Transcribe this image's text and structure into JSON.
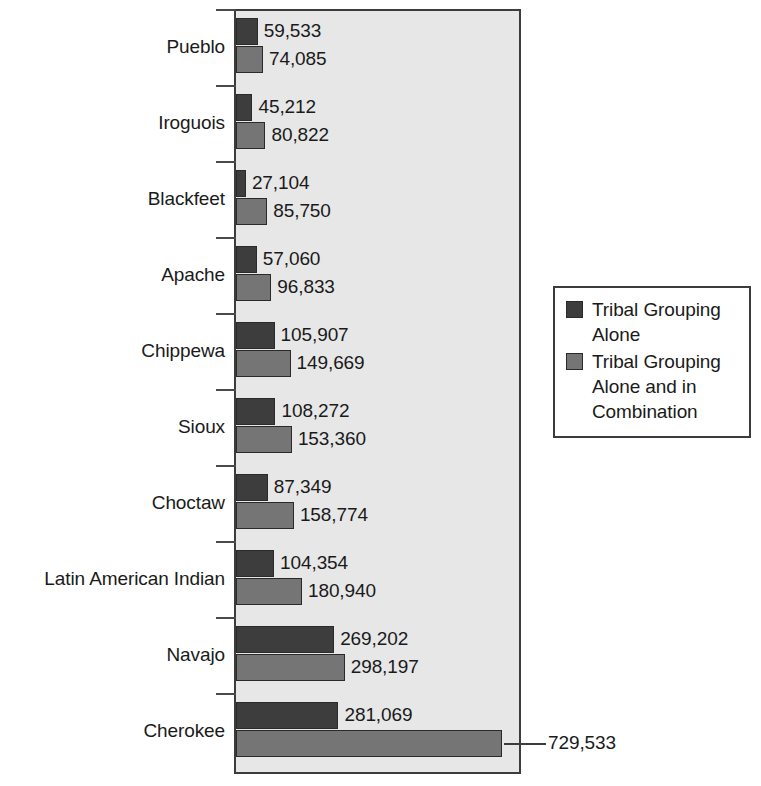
{
  "chart_data": {
    "type": "bar",
    "orientation": "horizontal",
    "title": "",
    "xlabel": "",
    "ylabel": "",
    "xlim": [
      0,
      729533
    ],
    "grid": false,
    "legend_position": "right",
    "categories": [
      "Pueblo",
      "Iroguois",
      "Blackfeet",
      "Apache",
      "Chippewa",
      "Sioux",
      "Choctaw",
      "Latin American Indian",
      "Navajo",
      "Cherokee"
    ],
    "series": [
      {
        "name": "Tribal Grouping Alone",
        "color": "#3d3d3d",
        "values": [
          59533,
          45212,
          27104,
          57060,
          105907,
          108272,
          87349,
          104354,
          269202,
          281069
        ],
        "labels": [
          "59,533",
          "45,212",
          "27,104",
          "57,060",
          "105,907",
          "108,272",
          "87,349",
          "104,354",
          "269,202",
          "281,069"
        ]
      },
      {
        "name": "Tribal Grouping Alone and in Combination",
        "color": "#757575",
        "values": [
          74085,
          80822,
          85750,
          96833,
          149669,
          153360,
          158774,
          180940,
          298197,
          729533
        ],
        "labels": [
          "74,085",
          "80,822",
          "85,750",
          "96,833",
          "149,669",
          "153,360",
          "158,774",
          "180,940",
          "298,197",
          "729,533"
        ]
      }
    ]
  },
  "legend": {
    "entries": [
      {
        "label": "Tribal Grouping Alone",
        "color": "#3d3d3d"
      },
      {
        "label": "Tribal Grouping Alone and in Combination",
        "color": "#757575"
      }
    ]
  },
  "colors": {
    "plot_background": "#e7e7e7",
    "frame": "#3c3c3c",
    "series_alone": "#3d3d3d",
    "series_combination": "#757575",
    "text": "#1a1a1a"
  }
}
